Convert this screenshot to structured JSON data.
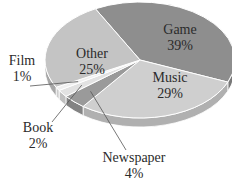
{
  "chart_data": {
    "type": "pie",
    "title": "",
    "style": "3d-grayscale",
    "categories": [
      "Game",
      "Music",
      "Newspaper",
      "Book",
      "Film",
      "Other"
    ],
    "values": [
      39,
      29,
      4,
      2,
      1,
      25
    ],
    "unit": "%",
    "colors": [
      "#8e8e8e",
      "#cfcfcf",
      "#9a9a9a",
      "#e2e2e2",
      "#f0f0f0",
      "#c4c4c4"
    ],
    "labels": [
      {
        "name": "Game",
        "value": "39%"
      },
      {
        "name": "Music",
        "value": "29%"
      },
      {
        "name": "Newspaper",
        "value": "4%"
      },
      {
        "name": "Book",
        "value": "2%"
      },
      {
        "name": "Film",
        "value": "1%"
      },
      {
        "name": "Other",
        "value": "25%"
      }
    ],
    "legend": "none (direct labels with leader lines for small slices)"
  }
}
